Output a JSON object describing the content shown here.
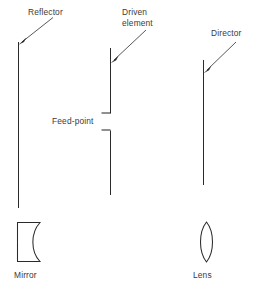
{
  "figure": {
    "background_color": "#ffffff",
    "line_color": "#2b2b2b",
    "text_color": "#3b3b3b"
  },
  "labels": {
    "reflector": "Reflector",
    "driven_element_line1": "Driven",
    "driven_element_line2": "element",
    "director": "Director",
    "feed_point": "Feed-point",
    "mirror": "Mirror",
    "lens": "Lens"
  },
  "elements": [
    {
      "name": "reflector",
      "label": "Reflector",
      "kind": "antenna-element",
      "x": 18,
      "y_top": 42,
      "y_bottom": 208,
      "length": 166,
      "split": false
    },
    {
      "name": "driven-element",
      "label": "Driven element",
      "kind": "antenna-element",
      "x": 110,
      "y_top": 48,
      "y_bottom": 195,
      "length": 147,
      "split": true,
      "gap_top": 113,
      "gap_bottom": 130,
      "feed_stub_length": 9
    },
    {
      "name": "director",
      "label": "Director",
      "kind": "antenna-element",
      "x": 203,
      "y_top": 60,
      "y_bottom": 185,
      "length": 125,
      "split": false
    }
  ],
  "optics": [
    {
      "name": "mirror",
      "label": "Mirror",
      "shape": "concave-mirror",
      "x": 17,
      "y": 222,
      "width": 23,
      "height": 40
    },
    {
      "name": "lens",
      "label": "Lens",
      "shape": "biconvex-lens",
      "x": 198,
      "y": 222,
      "width": 17,
      "height": 40
    }
  ],
  "leaders": [
    {
      "name": "reflector-leader",
      "from_x": 53,
      "from_y": 17,
      "to_x": 19,
      "to_y": 43
    },
    {
      "name": "driven-element-leader",
      "from_x": 145,
      "from_y": 30,
      "to_x": 112,
      "to_y": 62
    },
    {
      "name": "director-leader",
      "from_x": 235,
      "from_y": 42,
      "to_x": 205,
      "to_y": 72
    },
    {
      "name": "feed-point-leader-upper",
      "from_x": 103,
      "from_y": 113,
      "to_x": 112,
      "to_y": 113
    },
    {
      "name": "feed-point-leader-lower",
      "from_x": 103,
      "from_y": 130,
      "to_x": 112,
      "to_y": 130
    }
  ]
}
